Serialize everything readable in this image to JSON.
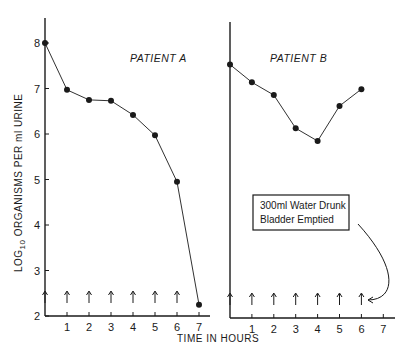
{
  "chart_data": {
    "type": "line",
    "ylabel_main": "LOG",
    "ylabel_sub": "10",
    "ylabel_rest": " ORGANISMS PER ml URINE",
    "xlabel": "TIME IN HOURS",
    "ylim": [
      2,
      8
    ],
    "yticks": [
      "2",
      "3",
      "4",
      "5",
      "6",
      "7",
      "8"
    ],
    "grid": false,
    "panels": [
      {
        "title": "PATIENT A",
        "xticks": [
          "1",
          "2",
          "3",
          "4",
          "5",
          "6",
          "7"
        ],
        "x": [
          0,
          1,
          2,
          3,
          4,
          5,
          6,
          7
        ],
        "values": [
          8.0,
          6.97,
          6.75,
          6.73,
          6.42,
          5.97,
          4.95,
          2.25
        ],
        "arrow_times": [
          0,
          1,
          2,
          3,
          4,
          5,
          6
        ]
      },
      {
        "title": "PATIENT B",
        "xticks": [
          "1",
          "2",
          "3",
          "4",
          "5",
          "6",
          "7"
        ],
        "x": [
          0,
          1,
          2,
          3,
          4,
          5,
          6
        ],
        "values": [
          7.57,
          7.18,
          6.9,
          6.17,
          5.89,
          6.66,
          7.03
        ],
        "arrow_times": [
          0,
          1,
          2,
          3,
          4,
          5,
          6
        ]
      }
    ],
    "annotation": {
      "line1": "300ml Water Drunk",
      "line2": "Bladder  Emptied"
    },
    "colors": {
      "ink": "#1a1a1a",
      "background": "#ffffff"
    }
  }
}
